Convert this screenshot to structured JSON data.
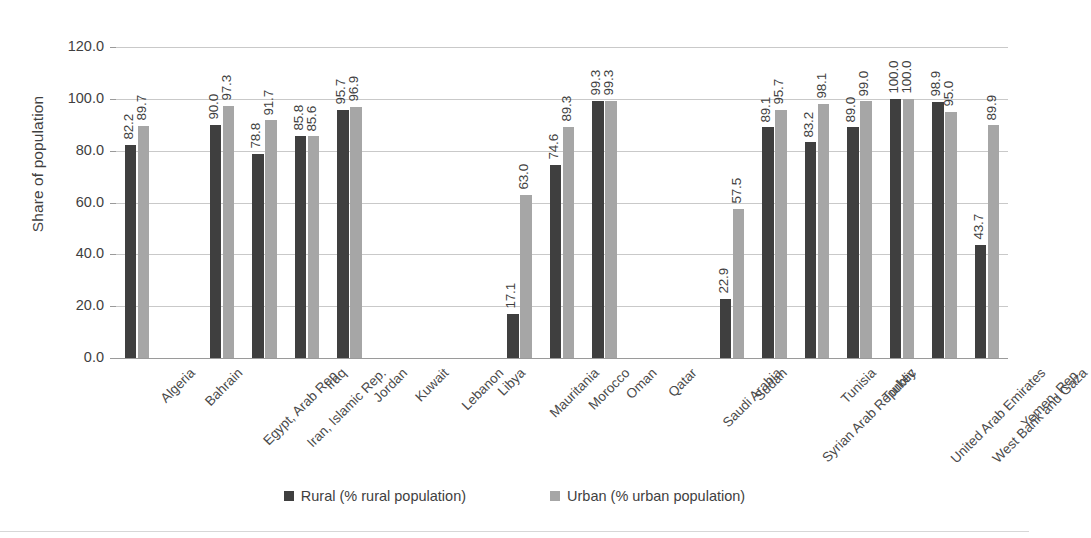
{
  "chart_data": {
    "type": "bar",
    "title": "",
    "xlabel": "",
    "ylabel": "Share of population",
    "ylim": [
      0,
      120
    ],
    "ytick_values": [
      0,
      20,
      40,
      60,
      80,
      100,
      120
    ],
    "ytick_labels": [
      "0.0",
      "20.0",
      "40.0",
      "60.0",
      "80.0",
      "100.0",
      "120.0"
    ],
    "grid": true,
    "legend_position": "bottom-center",
    "data_labels": true,
    "categories": [
      "Algeria",
      "Bahrain",
      "Egypt, Arab Rep.",
      "Iran, Islamic Rep.",
      "Iraq",
      "Jordan",
      "Kuwait",
      "Lebanon",
      "Libya",
      "Mauritania",
      "Morocco",
      "Oman",
      "Qatar",
      "Saudi Arabia",
      "Sudan",
      "Syrian Arab Republic",
      "Tunisia",
      "Turkey",
      "United Arab Emirates",
      "West Bank and Gaza",
      "Yemen, Rep."
    ],
    "series": [
      {
        "name": "Rural (% rural population)",
        "color": "#3f3f3f",
        "values": [
          82.2,
          null,
          90.0,
          78.8,
          85.8,
          95.7,
          null,
          null,
          null,
          17.1,
          74.6,
          99.3,
          null,
          null,
          22.9,
          89.1,
          83.2,
          89.0,
          100.0,
          98.9,
          43.7
        ],
        "labels": [
          "82.2",
          "",
          "90.0",
          "78.8",
          "85.8",
          "95.7",
          "",
          "",
          "",
          "17.1",
          "74.6",
          "99.3",
          "",
          "",
          "22.9",
          "89.1",
          "83.2",
          "89.0",
          "100.0",
          "98.9",
          "43.7"
        ]
      },
      {
        "name": "Urban (% urban population)",
        "color": "#a6a6a6",
        "values": [
          89.7,
          null,
          97.3,
          91.7,
          85.6,
          96.9,
          null,
          null,
          null,
          63.0,
          89.3,
          99.3,
          null,
          null,
          57.5,
          95.7,
          98.1,
          99.0,
          100.0,
          95.0,
          89.9
        ],
        "labels": [
          "89.7",
          "",
          "97.3",
          "91.7",
          "85.6",
          "96.9",
          "",
          "",
          "",
          "63.0",
          "89.3",
          "99.3",
          "",
          "",
          "57.5",
          "95.7",
          "98.1",
          "99.0",
          "100.0",
          "95.0",
          "89.9"
        ]
      }
    ]
  },
  "legend": {
    "items": [
      {
        "label": "Rural (% rural population)",
        "swatch": "rural"
      },
      {
        "label": "Urban (% urban population)",
        "swatch": "urban"
      }
    ]
  },
  "axis": {
    "y_title": "Share of population"
  }
}
